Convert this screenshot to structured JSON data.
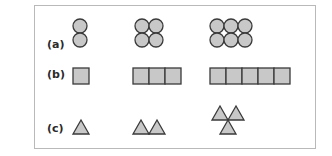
{
  "rows": [
    {
      "label": "(a)",
      "shape": "circle",
      "counts": [
        2,
        4,
        6
      ]
    },
    {
      "label": "(b)",
      "shape": "square",
      "counts": [
        1,
        3,
        5
      ]
    },
    {
      "label": "(c)",
      "shape": "triangle",
      "counts": [
        1,
        2,
        3
      ]
    }
  ],
  "colors": {
    "fill": "#c8c8c8",
    "stroke": "#3a3a3a",
    "frame": "#b9b9b9"
  }
}
